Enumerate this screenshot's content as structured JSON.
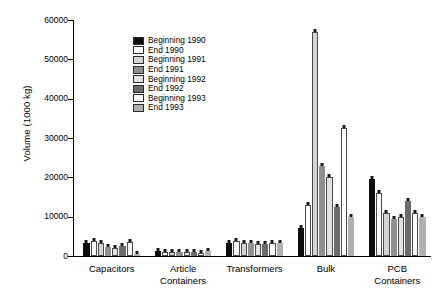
{
  "chart_data": {
    "type": "bar",
    "title": "",
    "subtitle": "",
    "xlabel": "",
    "ylabel": "Volume (1000 kg)",
    "ylim": [
      0,
      60000
    ],
    "ytick_labels": [
      "0",
      "10000",
      "20000",
      "30000",
      "40000",
      "50000",
      "60000"
    ],
    "ytick_values": [
      0,
      10000,
      20000,
      30000,
      40000,
      50000,
      60000
    ],
    "grid": false,
    "legend_position": "upper-center-left",
    "marker_note": "small dark square marker at the top of each bar",
    "categories": [
      "Capacitors",
      "Article Containers",
      "Transformers",
      "Bulk",
      "PCB Containers"
    ],
    "category_lines": [
      [
        "Capacitors"
      ],
      [
        "Article",
        "Containers"
      ],
      [
        "Transformers"
      ],
      [
        "Bulk"
      ],
      [
        "PCB",
        "Containers"
      ]
    ],
    "series": [
      {
        "name": "Beginning 1990",
        "color": "#0d0d0d",
        "values": [
          3400,
          1400,
          3300,
          7000,
          19500
        ]
      },
      {
        "name": "End 1990",
        "color": "#ffffff",
        "values": [
          3700,
          1100,
          3900,
          13000,
          16000
        ]
      },
      {
        "name": "Beginning 1991",
        "color": "#d4d4d4",
        "values": [
          3300,
          900,
          3200,
          57000,
          11000
        ]
      },
      {
        "name": "End 1991",
        "color": "#8f8f8f",
        "values": [
          2400,
          900,
          3200,
          23000,
          9500
        ]
      },
      {
        "name": "Beginning 1992",
        "color": "#e2e2e2",
        "values": [
          2000,
          1100,
          3100,
          20000,
          9800
        ]
      },
      {
        "name": "End 1992",
        "color": "#6b6b6b",
        "values": [
          2600,
          1100,
          3100,
          12500,
          14000
        ]
      },
      {
        "name": "Beginning 1993",
        "color": "#fdfdfd",
        "values": [
          3500,
          700,
          3300,
          32500,
          11000
        ]
      },
      {
        "name": "End 1993",
        "color": "#b0b0b0",
        "values": [
          500,
          1200,
          3300,
          10000,
          10000
        ]
      }
    ]
  },
  "legend": {
    "items": [
      {
        "label": "Beginning 1990"
      },
      {
        "label": "End 1990"
      },
      {
        "label": "Beginning 1991"
      },
      {
        "label": "End 1991"
      },
      {
        "label": "Beginning 1992"
      },
      {
        "label": "End 1992"
      },
      {
        "label": "Beginning 1993"
      },
      {
        "label": "End 1993"
      }
    ]
  }
}
